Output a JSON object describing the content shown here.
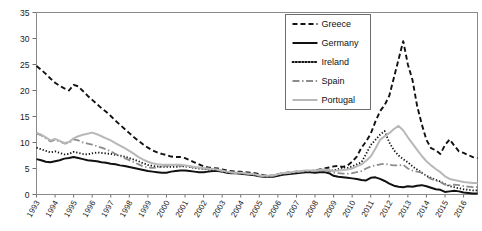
{
  "chart_data": {
    "type": "line",
    "title": "",
    "subtitle": "",
    "xlabel": "",
    "ylabel": "",
    "xlim": [
      1993,
      2016.75
    ],
    "ylim": [
      0,
      35
    ],
    "ytick_values": [
      0,
      5,
      10,
      15,
      20,
      25,
      30,
      35
    ],
    "ytick_labels": [
      "0",
      "5",
      "10",
      "15",
      "20",
      "25",
      "30",
      "35"
    ],
    "grid": false,
    "legend_position": "top-right",
    "xtick_labels": [
      "1993",
      "1994",
      "1995",
      "1996",
      "1997",
      "1998",
      "1999",
      "2000",
      "2001",
      "2002",
      "2003",
      "2004",
      "2005",
      "2006",
      "2007",
      "2008",
      "2009",
      "2010",
      "2011",
      "2012",
      "2013",
      "2014",
      "2015",
      "2016"
    ],
    "x": [
      1993.0,
      1993.25,
      1993.5,
      1993.75,
      1994.0,
      1994.25,
      1994.5,
      1994.75,
      1995.0,
      1995.25,
      1995.5,
      1995.75,
      1996.0,
      1996.25,
      1996.5,
      1996.75,
      1997.0,
      1997.25,
      1997.5,
      1997.75,
      1998.0,
      1998.25,
      1998.5,
      1998.75,
      1999.0,
      1999.25,
      1999.5,
      1999.75,
      2000.0,
      2000.25,
      2000.5,
      2000.75,
      2001.0,
      2001.25,
      2001.5,
      2001.75,
      2002.0,
      2002.25,
      2002.5,
      2002.75,
      2003.0,
      2003.25,
      2003.5,
      2003.75,
      2004.0,
      2004.25,
      2004.5,
      2004.75,
      2005.0,
      2005.25,
      2005.5,
      2005.75,
      2006.0,
      2006.25,
      2006.5,
      2006.75,
      2007.0,
      2007.25,
      2007.5,
      2007.75,
      2008.0,
      2008.25,
      2008.5,
      2008.75,
      2009.0,
      2009.25,
      2009.5,
      2009.75,
      2010.0,
      2010.25,
      2010.5,
      2010.75,
      2011.0,
      2011.25,
      2011.5,
      2011.75,
      2012.0,
      2012.25,
      2012.5,
      2012.75,
      2013.0,
      2013.25,
      2013.5,
      2013.75,
      2014.0,
      2014.25,
      2014.5,
      2014.75,
      2015.0,
      2015.25,
      2015.5,
      2015.75,
      2016.0,
      2016.25,
      2016.5,
      2016.75
    ],
    "series": [
      {
        "name": "Greece",
        "style": "dashed",
        "color": "#111111",
        "width": 1.9,
        "values": [
          24.7,
          24.0,
          23.2,
          22.3,
          21.5,
          20.9,
          20.4,
          20.0,
          21.1,
          20.8,
          19.9,
          19.0,
          18.2,
          17.4,
          16.6,
          15.9,
          15.1,
          14.2,
          13.4,
          12.6,
          11.8,
          11.0,
          10.3,
          9.6,
          9.0,
          8.5,
          8.1,
          7.8,
          7.6,
          7.3,
          7.2,
          7.2,
          7.0,
          6.6,
          6.2,
          5.8,
          5.4,
          5.2,
          5.1,
          5.0,
          4.8,
          4.6,
          4.5,
          4.4,
          4.4,
          4.3,
          4.2,
          4.1,
          3.9,
          3.7,
          3.6,
          3.6,
          3.9,
          4.1,
          4.2,
          4.3,
          4.4,
          4.5,
          4.5,
          4.5,
          4.6,
          4.8,
          5.0,
          5.2,
          5.4,
          5.5,
          5.3,
          5.6,
          6.3,
          7.3,
          9.0,
          10.2,
          11.7,
          14.0,
          16.0,
          17.2,
          19.0,
          22.5,
          26.0,
          29.5,
          25.0,
          22.0,
          17.0,
          13.5,
          10.5,
          8.9,
          8.5,
          7.8,
          9.5,
          10.6,
          9.4,
          8.3,
          8.0,
          7.6,
          7.2,
          7.0
        ]
      },
      {
        "name": "Germany",
        "style": "solid",
        "color": "#111111",
        "width": 2.0,
        "values": [
          6.8,
          6.6,
          6.3,
          6.2,
          6.4,
          6.6,
          6.9,
          7.0,
          7.2,
          7.0,
          6.8,
          6.6,
          6.5,
          6.4,
          6.2,
          6.1,
          5.9,
          5.8,
          5.6,
          5.5,
          5.3,
          5.1,
          4.9,
          4.7,
          4.5,
          4.4,
          4.3,
          4.2,
          4.2,
          4.4,
          4.5,
          4.6,
          4.6,
          4.5,
          4.4,
          4.3,
          4.3,
          4.4,
          4.5,
          4.5,
          4.4,
          4.2,
          4.1,
          4.1,
          4.0,
          3.9,
          3.8,
          3.7,
          3.5,
          3.4,
          3.4,
          3.4,
          3.6,
          3.8,
          3.9,
          4.0,
          4.1,
          4.2,
          4.3,
          4.3,
          4.2,
          4.3,
          4.3,
          4.1,
          3.6,
          3.4,
          3.3,
          3.2,
          3.1,
          3.0,
          2.8,
          2.7,
          3.2,
          3.3,
          3.0,
          2.6,
          2.1,
          1.7,
          1.5,
          1.4,
          1.6,
          1.5,
          1.7,
          1.8,
          1.6,
          1.3,
          1.0,
          0.9,
          0.5,
          0.6,
          0.7,
          0.6,
          0.4,
          0.3,
          0.2,
          0.2
        ]
      },
      {
        "name": "Ireland",
        "style": "dotted",
        "color": "#111111",
        "width": 1.8,
        "values": [
          9.0,
          8.7,
          8.4,
          8.1,
          8.3,
          8.0,
          7.7,
          7.8,
          8.2,
          8.0,
          7.8,
          7.7,
          7.9,
          8.1,
          8.0,
          7.9,
          7.8,
          7.6,
          7.5,
          7.3,
          7.0,
          6.7,
          6.4,
          6.0,
          5.7,
          5.5,
          5.4,
          5.3,
          5.3,
          5.3,
          5.3,
          5.4,
          5.4,
          5.3,
          5.1,
          5.0,
          4.9,
          4.8,
          4.7,
          4.5,
          4.4,
          4.3,
          4.2,
          4.1,
          4.1,
          4.0,
          3.9,
          3.8,
          3.6,
          3.5,
          3.5,
          3.6,
          3.8,
          4.0,
          4.1,
          4.2,
          4.3,
          4.4,
          4.5,
          4.5,
          4.6,
          4.7,
          4.8,
          4.7,
          4.6,
          4.9,
          5.2,
          5.1,
          5.4,
          5.8,
          6.2,
          7.8,
          9.5,
          10.5,
          11.5,
          12.2,
          10.0,
          8.5,
          7.5,
          6.8,
          6.2,
          5.4,
          4.8,
          4.2,
          3.6,
          3.2,
          2.8,
          2.5,
          2.0,
          1.6,
          1.4,
          1.2,
          1.0,
          0.9,
          0.8,
          0.8
        ]
      },
      {
        "name": "Spain",
        "style": "dashdot",
        "color": "#8c8c8c",
        "width": 1.8,
        "values": [
          11.7,
          11.4,
          10.8,
          10.2,
          10.5,
          10.2,
          9.8,
          9.9,
          10.6,
          10.4,
          10.0,
          9.8,
          9.6,
          9.3,
          9.0,
          8.7,
          8.3,
          7.8,
          7.4,
          7.0,
          6.6,
          6.2,
          5.8,
          5.4,
          5.2,
          5.1,
          5.2,
          5.4,
          5.5,
          5.6,
          5.6,
          5.5,
          5.4,
          5.3,
          5.2,
          5.1,
          5.0,
          4.9,
          4.8,
          4.7,
          4.5,
          4.3,
          4.2,
          4.1,
          4.1,
          4.0,
          3.9,
          3.8,
          3.6,
          3.5,
          3.5,
          3.6,
          3.8,
          4.0,
          4.1,
          4.2,
          4.3,
          4.4,
          4.5,
          4.5,
          4.5,
          4.6,
          4.7,
          4.5,
          4.2,
          4.1,
          4.0,
          4.0,
          4.1,
          4.3,
          4.5,
          5.0,
          5.4,
          5.6,
          5.8,
          5.9,
          5.7,
          5.6,
          5.6,
          5.7,
          5.0,
          4.6,
          4.4,
          4.2,
          3.5,
          3.0,
          2.7,
          2.4,
          1.9,
          1.8,
          1.9,
          1.8,
          1.6,
          1.5,
          1.4,
          1.4
        ]
      },
      {
        "name": "Portugal",
        "style": "solid",
        "color": "#b8b8b8",
        "width": 2.0,
        "values": [
          11.9,
          11.5,
          11.0,
          10.4,
          10.7,
          10.3,
          9.9,
          10.1,
          10.8,
          11.2,
          11.5,
          11.7,
          11.9,
          11.6,
          11.2,
          10.8,
          10.4,
          9.9,
          9.4,
          8.9,
          8.4,
          7.8,
          7.2,
          6.7,
          6.3,
          6.0,
          5.8,
          5.7,
          5.7,
          5.7,
          5.7,
          5.7,
          5.6,
          5.5,
          5.3,
          5.2,
          5.1,
          5.0,
          4.9,
          4.8,
          4.6,
          4.4,
          4.3,
          4.2,
          4.2,
          4.1,
          4.0,
          3.9,
          3.7,
          3.6,
          3.6,
          3.7,
          3.9,
          4.1,
          4.2,
          4.3,
          4.4,
          4.5,
          4.6,
          4.6,
          4.6,
          4.7,
          4.8,
          4.7,
          4.5,
          4.6,
          4.7,
          4.8,
          5.0,
          5.4,
          5.8,
          6.5,
          7.3,
          8.8,
          10.5,
          11.2,
          11.8,
          12.6,
          13.2,
          12.3,
          11.0,
          9.8,
          8.6,
          7.4,
          6.4,
          5.6,
          4.9,
          4.3,
          3.5,
          3.0,
          2.8,
          2.6,
          2.4,
          2.3,
          2.2,
          2.2
        ]
      }
    ]
  },
  "legend": {
    "items": [
      {
        "label": "Greece"
      },
      {
        "label": "Germany"
      },
      {
        "label": "Ireland"
      },
      {
        "label": "Spain"
      },
      {
        "label": "Portugal"
      }
    ]
  }
}
